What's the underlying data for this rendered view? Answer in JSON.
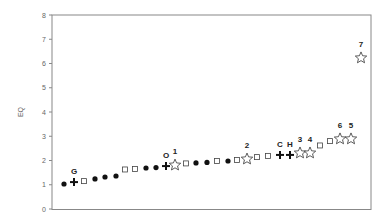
{
  "chart_data": {
    "type": "scatter",
    "title": "",
    "xlabel": "",
    "ylabel": "EQ",
    "ylim": [
      0,
      8
    ],
    "yticks": [
      0,
      1,
      2,
      3,
      4,
      5,
      6,
      7,
      8
    ],
    "grid": false,
    "legend": null,
    "x": [
      1,
      2,
      3,
      4,
      5,
      6,
      7,
      8,
      9,
      10,
      11,
      12,
      13,
      14,
      15,
      16,
      17,
      18,
      19,
      20,
      21,
      22,
      23,
      24,
      25,
      26,
      27,
      28,
      29,
      30
    ],
    "points": [
      {
        "rank": 1,
        "eq": 1.03,
        "marker": "dot",
        "label": ""
      },
      {
        "rank": 2,
        "eq": 1.11,
        "marker": "plus",
        "label": "G"
      },
      {
        "rank": 3,
        "eq": 1.15,
        "marker": "square",
        "label": ""
      },
      {
        "rank": 4,
        "eq": 1.24,
        "marker": "dot",
        "label": ""
      },
      {
        "rank": 5,
        "eq": 1.32,
        "marker": "dot",
        "label": ""
      },
      {
        "rank": 6,
        "eq": 1.36,
        "marker": "dot",
        "label": ""
      },
      {
        "rank": 7,
        "eq": 1.63,
        "marker": "square",
        "label": ""
      },
      {
        "rank": 8,
        "eq": 1.65,
        "marker": "square",
        "label": ""
      },
      {
        "rank": 9,
        "eq": 1.69,
        "marker": "dot",
        "label": ""
      },
      {
        "rank": 10,
        "eq": 1.71,
        "marker": "dot",
        "label": ""
      },
      {
        "rank": 11,
        "eq": 1.77,
        "marker": "plus",
        "label": "O"
      },
      {
        "rank": 12,
        "eq": 1.81,
        "marker": "star",
        "label": "1"
      },
      {
        "rank": 13,
        "eq": 1.88,
        "marker": "square",
        "label": ""
      },
      {
        "rank": 14,
        "eq": 1.9,
        "marker": "dot",
        "label": ""
      },
      {
        "rank": 15,
        "eq": 1.92,
        "marker": "dot",
        "label": ""
      },
      {
        "rank": 16,
        "eq": 1.98,
        "marker": "square",
        "label": ""
      },
      {
        "rank": 17,
        "eq": 1.98,
        "marker": "dot",
        "label": ""
      },
      {
        "rank": 18,
        "eq": 2.02,
        "marker": "square",
        "label": ""
      },
      {
        "rank": 19,
        "eq": 2.06,
        "marker": "star",
        "label": "2"
      },
      {
        "rank": 20,
        "eq": 2.14,
        "marker": "square",
        "label": ""
      },
      {
        "rank": 21,
        "eq": 2.19,
        "marker": "square",
        "label": ""
      },
      {
        "rank": 22,
        "eq": 2.23,
        "marker": "plus",
        "label": "C"
      },
      {
        "rank": 23,
        "eq": 2.23,
        "marker": "plus",
        "label": "H"
      },
      {
        "rank": 24,
        "eq": 2.31,
        "marker": "star",
        "label": "3"
      },
      {
        "rank": 25,
        "eq": 2.31,
        "marker": "star",
        "label": "4"
      },
      {
        "rank": 26,
        "eq": 2.62,
        "marker": "square",
        "label": ""
      },
      {
        "rank": 27,
        "eq": 2.8,
        "marker": "square",
        "label": ""
      },
      {
        "rank": 28,
        "eq": 2.89,
        "marker": "star",
        "label": "6"
      },
      {
        "rank": 29,
        "eq": 2.89,
        "marker": "star",
        "label": "5"
      },
      {
        "rank": 30,
        "eq": 6.23,
        "marker": "star",
        "label": "7"
      }
    ],
    "px": [
      64,
      74,
      84,
      95,
      105,
      116,
      125,
      135,
      146,
      156,
      166,
      175,
      186,
      196,
      207,
      217,
      228,
      237,
      247,
      257,
      268,
      280,
      290,
      300,
      310,
      320,
      330,
      340,
      351,
      361
    ]
  }
}
